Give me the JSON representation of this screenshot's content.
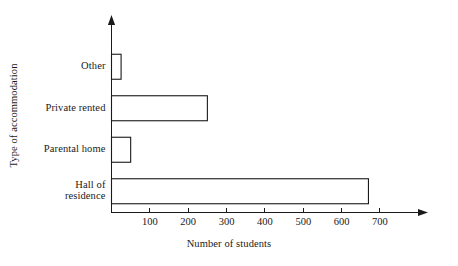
{
  "chart_data": {
    "type": "bar",
    "orientation": "horizontal",
    "title": "",
    "xlabel": "Number of students",
    "ylabel": "Type of accommodation",
    "categories": [
      "Other",
      "Private rented",
      "Parental home",
      "Hall of\nresidence"
    ],
    "values": [
      25,
      250,
      50,
      670
    ],
    "xticks": [
      100,
      200,
      300,
      400,
      500,
      600,
      700
    ],
    "xtick_labels": [
      "100",
      "200",
      "300",
      "400",
      "500",
      "600",
      "700"
    ],
    "xlim": [
      0,
      820
    ],
    "ylim": [
      0,
      4
    ],
    "grid": false,
    "legend": null,
    "bar_fill": "#ffffff",
    "bar_stroke": "#1a1a1a",
    "axis_color": "#1a1a1a",
    "background": "#ffffff",
    "series": [
      {
        "name": "Number of students",
        "values": [
          25,
          250,
          50,
          670
        ]
      }
    ]
  }
}
